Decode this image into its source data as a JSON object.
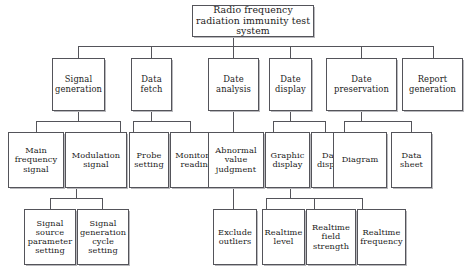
{
  "diagram": {
    "title": "Radio frequency radiation immunity test system",
    "type": "tree-hierarchy-block-diagram",
    "levels": 4,
    "root": {
      "label": "Radio frequency radiation immunity test system"
    },
    "level2": [
      {
        "label": "Signal generation"
      },
      {
        "label": "Data fetch"
      },
      {
        "label": "Date analysis"
      },
      {
        "label": "Date display"
      },
      {
        "label": "Date preservation"
      },
      {
        "label": "Report generation"
      }
    ],
    "level3": [
      {
        "label": "Main frequency signal",
        "parent": "Signal generation"
      },
      {
        "label": "Modulation signal",
        "parent": "Signal generation"
      },
      {
        "label": "Probe setting",
        "parent": "Data fetch"
      },
      {
        "label": "Monitoring readings",
        "parent": "Data fetch"
      },
      {
        "label": "Abnormal value judgment",
        "parent": "Date analysis"
      },
      {
        "label": "Graphic display",
        "parent": "Date display"
      },
      {
        "label": "Data display",
        "parent": "Date display"
      },
      {
        "label": "Diagram",
        "parent": "Date preservation"
      },
      {
        "label": "Data sheet",
        "parent": "Date preservation"
      }
    ],
    "level4": [
      {
        "label": "Signal source parameter setting",
        "parent": "Main frequency signal"
      },
      {
        "label": "Signal generation cycle setting",
        "parent": "Modulation signal"
      },
      {
        "label": "Exclude outliers",
        "parent": "Abnormal value judgment"
      },
      {
        "label": "Realtime level",
        "parent": "Graphic display"
      },
      {
        "label": "Realtime field strength",
        "parent": "Graphic display"
      },
      {
        "label": "Realtime frequency",
        "parent": "Graphic display"
      }
    ]
  }
}
